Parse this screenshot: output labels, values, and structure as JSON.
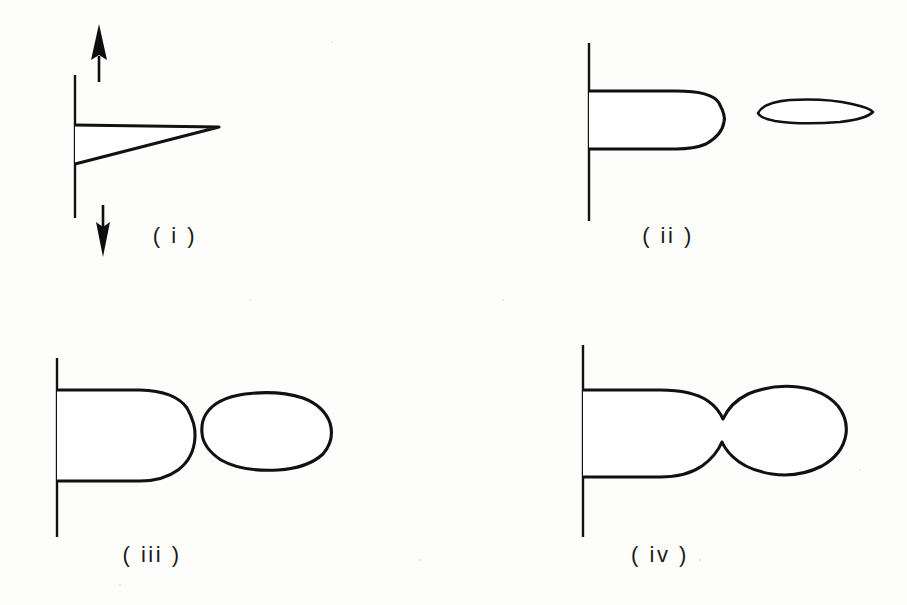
{
  "figure": {
    "kind": "line-drawing",
    "background_color": "#fdfdfb",
    "ink_color": "#111111",
    "stipple_color": "#111111",
    "panel_count": 4
  },
  "panels": [
    {
      "id": "i",
      "label": "( i )",
      "label_x": 175,
      "label_y": 243,
      "wall": {
        "x": 75,
        "y_top": 75,
        "y_bottom": 218
      },
      "arrows": [
        {
          "name": "up-arrow",
          "direction": "up",
          "x": 99,
          "tip_y": 26,
          "tail_y": 82
        },
        {
          "name": "down-arrow",
          "direction": "down",
          "x": 103,
          "tip_y": 255,
          "tail_y": 205
        }
      ],
      "bodies": [
        {
          "name": "attached-wedge",
          "form": "tapered-wedge",
          "x_start": 75,
          "x_end": 219,
          "y_top": 125,
          "y_bottom_at_wall": 163,
          "attached": true,
          "stipple_density": "medium"
        }
      ],
      "detached_bodies": 0
    },
    {
      "id": "ii",
      "label": "( ii )",
      "label_x": 668,
      "label_y": 243,
      "wall": {
        "x": 589,
        "y_top": 43,
        "y_bottom": 221
      },
      "arrows": [],
      "bodies": [
        {
          "name": "attached-lobe",
          "form": "rounded-cap-column",
          "x_start": 589,
          "x_end": 723,
          "y_top": 91,
          "y_bottom": 149,
          "attached": true,
          "stipple_density": "high"
        },
        {
          "name": "detached-thin-ellipse",
          "form": "flat-lens",
          "x_start": 757,
          "x_end": 873,
          "y_top": 100,
          "y_bottom": 123,
          "attached": false,
          "stipple_density": "medium"
        }
      ],
      "detached_bodies": 1
    },
    {
      "id": "iii",
      "label": "( iii )",
      "label_x": 152,
      "label_y": 562,
      "wall": {
        "x": 57,
        "y_top": 358,
        "y_bottom": 537
      },
      "arrows": [],
      "bodies": [
        {
          "name": "attached-lobe",
          "form": "rounded-cap-column",
          "x_start": 57,
          "x_end": 194,
          "y_top": 390,
          "y_bottom": 481,
          "attached": true,
          "stipple_density": "high"
        },
        {
          "name": "detached-ovoid",
          "form": "tapered-ovoid",
          "x_start": 200,
          "x_end": 331,
          "y_top": 394,
          "y_bottom": 470,
          "attached": false,
          "stipple_density": "high"
        }
      ],
      "detached_bodies": 1
    },
    {
      "id": "iv",
      "label": "( iv )",
      "label_x": 660,
      "label_y": 562,
      "wall": {
        "x": 583,
        "y_top": 345,
        "y_bottom": 537
      },
      "arrows": [],
      "bodies": [
        {
          "name": "pinched-dumbbell",
          "form": "dumbbell-with-neck",
          "x_start": 583,
          "x_end": 845,
          "y_top": 390,
          "y_bottom": 477,
          "neck_x": 723,
          "neck_half_height": 12,
          "attached": true,
          "stipple_density": "high"
        }
      ],
      "detached_bodies": 0
    }
  ]
}
